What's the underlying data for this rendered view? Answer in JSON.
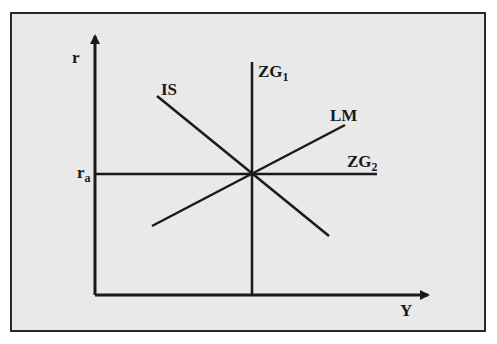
{
  "diagram": {
    "type": "IS-LM diagram",
    "axes": {
      "y_label": "r",
      "x_label": "Y",
      "y_tick_label": {
        "base": "r",
        "sub": "a"
      }
    },
    "curves": [
      {
        "id": "IS",
        "label": "IS",
        "from": [
          157,
          96
        ],
        "to": [
          329,
          236
        ]
      },
      {
        "id": "LM",
        "label": "LM",
        "from": [
          152,
          226
        ],
        "to": [
          345,
          125
        ]
      },
      {
        "id": "ZG1",
        "label_base": "ZG",
        "label_sub": "1",
        "from": [
          252,
          62
        ],
        "to": [
          252,
          295
        ]
      },
      {
        "id": "ZG2",
        "label_base": "ZG",
        "label_sub": "2",
        "from": [
          95,
          174
        ],
        "to": [
          377,
          174
        ]
      }
    ],
    "equilibrium": [
      252,
      174
    ],
    "colors": {
      "line": "#1a1a1a",
      "background": "#e9e9e9",
      "border": "#2a2a2a"
    }
  }
}
